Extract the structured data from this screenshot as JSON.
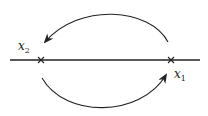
{
  "diagram": {
    "points": [
      {
        "id": "x1",
        "label": "x",
        "subscript": "1",
        "x": 171,
        "y": 60
      },
      {
        "id": "x2",
        "label": "x",
        "subscript": "2",
        "x": 41,
        "y": 60
      }
    ],
    "axis": {
      "x_start": 10,
      "x_end": 200,
      "y": 60
    },
    "arcs": [
      {
        "name": "upper-arc",
        "from": "x1",
        "to": "x2",
        "direction": "counterclockwise-over-top"
      },
      {
        "name": "lower-arc",
        "from": "x2",
        "to": "x1",
        "direction": "under-bottom"
      }
    ],
    "colors": {
      "stroke": "#222222",
      "background": "#ffffff"
    }
  }
}
